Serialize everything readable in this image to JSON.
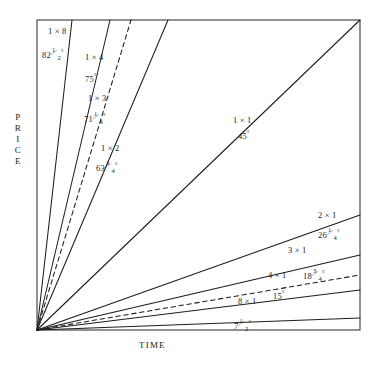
{
  "chart_data": {
    "type": "line",
    "title": "",
    "xlabel": "TIME",
    "ylabel": "PRICE",
    "origin": [
      37,
      330
    ],
    "plot_box": {
      "left": 37,
      "top": 20,
      "right": 360,
      "bottom": 330
    },
    "xlim": [
      0,
      1
    ],
    "ylim": [
      0,
      1
    ],
    "grid": false,
    "legend": null,
    "note": "W. D. Gann price/time angle fan radiating from the lower-left origin. Each ray is labelled with its price-by-time ratio and its angle in degrees.",
    "series": [
      {
        "name": "1 x 8",
        "ratio": "1 x 8",
        "angle_deg": 82.5,
        "angle_text": "82 1/2",
        "style": "solid",
        "end": [
          72,
          20
        ]
      },
      {
        "name": "1 x 4",
        "ratio": "1 x 4",
        "angle_deg": 75.0,
        "angle_text": "75",
        "style": "solid",
        "end": [
          110,
          20
        ]
      },
      {
        "name": "1 x 3",
        "ratio": "1 x 3",
        "angle_deg": 71.25,
        "angle_text": "71 1/4",
        "style": "dashed",
        "end": [
          131,
          20
        ]
      },
      {
        "name": "1 x 2",
        "ratio": "1 x 2",
        "angle_deg": 63.75,
        "angle_text": "63 3/4",
        "style": "solid",
        "end": [
          168,
          20
        ]
      },
      {
        "name": "1 x 1",
        "ratio": "1 x 1",
        "angle_deg": 45.0,
        "angle_text": "45",
        "style": "solid",
        "end": [
          360,
          20
        ]
      },
      {
        "name": "2 x 1",
        "ratio": "2 x 1",
        "angle_deg": 26.25,
        "angle_text": "26 1/4",
        "style": "solid",
        "end": [
          360,
          215
        ]
      },
      {
        "name": "3 x 1",
        "ratio": "3 x 1",
        "angle_deg": 18.75,
        "angle_text": "18 3/4",
        "style": "solid",
        "end": [
          360,
          255
        ]
      },
      {
        "name": "4 x 1",
        "ratio": "4 x 1",
        "angle_deg": 15.0,
        "angle_text": "15",
        "style": "dashed",
        "end": [
          360,
          275
        ]
      },
      {
        "name": "8 x 1",
        "ratio": "8 x 1",
        "angle_deg": 7.5,
        "angle_text": "7 1/2",
        "style": "solid",
        "end": [
          360,
          290
        ]
      },
      {
        "name": "lowest",
        "ratio": "",
        "angle_deg": null,
        "angle_text": "",
        "style": "solid",
        "end": [
          360,
          318
        ]
      }
    ],
    "labels": [
      {
        "id": "ratio-1x8",
        "text": "1 × 8",
        "x": 48,
        "y": 27
      },
      {
        "id": "angle-1x8",
        "whole": "82",
        "frac_n": "1",
        "frac_d": "2",
        "degree": true,
        "x": 42,
        "y": 49
      },
      {
        "id": "ratio-1x4",
        "text": "1 × 4",
        "x": 85,
        "y": 53
      },
      {
        "id": "angle-1x4",
        "whole": "75",
        "degree": true,
        "x": 85,
        "y": 73
      },
      {
        "id": "ratio-1x3",
        "text": "1 × 3",
        "x": 88,
        "y": 94
      },
      {
        "id": "angle-1x3",
        "whole": "71",
        "frac_n": "1",
        "frac_d": "4",
        "degree": true,
        "x": 84,
        "y": 113
      },
      {
        "id": "ratio-1x2",
        "text": "1 × 2",
        "x": 101,
        "y": 144
      },
      {
        "id": "angle-1x2",
        "whole": "63",
        "frac_n": "3",
        "frac_d": "4",
        "degree": true,
        "x": 96,
        "y": 162
      },
      {
        "id": "ratio-1x1",
        "text": "1 × 1",
        "x": 233,
        "y": 116
      },
      {
        "id": "angle-1x1",
        "whole": "45",
        "degree": true,
        "x": 238,
        "y": 130
      },
      {
        "id": "ratio-2x1",
        "text": "2 × 1",
        "x": 318,
        "y": 211
      },
      {
        "id": "angle-2x1",
        "whole": "26",
        "frac_n": "1",
        "frac_d": "4",
        "degree": true,
        "x": 318,
        "y": 229
      },
      {
        "id": "ratio-3x1",
        "text": "3 × 1",
        "x": 288,
        "y": 246
      },
      {
        "id": "ratio-4x1",
        "text": "4 × 1",
        "x": 268,
        "y": 271
      },
      {
        "id": "angle-3x1",
        "whole": "18",
        "frac_n": "3",
        "frac_d": "4",
        "degree": true,
        "x": 303,
        "y": 270
      },
      {
        "id": "ratio-8x1",
        "text": "8 × 1",
        "x": 238,
        "y": 297
      },
      {
        "id": "angle-4x1",
        "whole": "15",
        "degree": true,
        "x": 273,
        "y": 290
      },
      {
        "id": "angle-8x1",
        "whole": "7",
        "frac_n": "1",
        "frac_d": "2",
        "degree": true,
        "x": 234,
        "y": 320
      }
    ]
  },
  "axes": {
    "price_label": "PRICE",
    "price_letters": [
      "P",
      "R",
      "I",
      "C",
      "E"
    ],
    "time_label": "TIME"
  },
  "colors": {
    "line": "#1d1d1d",
    "frame": "#3a3a3a",
    "background": "#ffffff",
    "text": "#1d1d1d"
  }
}
